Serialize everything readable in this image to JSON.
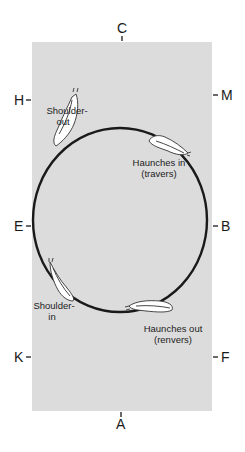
{
  "diagram": {
    "type": "dressage-arena-circle",
    "colors": {
      "arena_fill": "#dcdcdc",
      "circle_stroke": "#1a1a1a",
      "horse_fill": "#ffffff",
      "horse_stroke": "#333333",
      "text": "#1a1a1a"
    },
    "markers": {
      "top": "C",
      "bottom": "A",
      "left_upper": "H",
      "left_middle": "E",
      "left_lower": "K",
      "right_upper": "M",
      "right_middle": "B",
      "right_lower": "F"
    },
    "movements": [
      {
        "id": "shoulder-out",
        "line1": "Shoulder-",
        "line2": "out"
      },
      {
        "id": "haunches-in",
        "line1": "Haunches in",
        "line2": "(travers)"
      },
      {
        "id": "shoulder-in",
        "line1": "Shoulder-",
        "line2": "in"
      },
      {
        "id": "haunches-out",
        "line1": "Haunches out",
        "line2": "(renvers)"
      }
    ]
  }
}
